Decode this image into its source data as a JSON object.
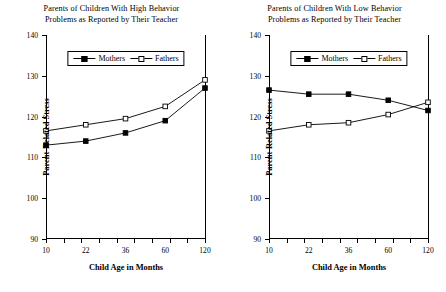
{
  "figure": {
    "width": 446,
    "height": 292,
    "background": "#ffffff",
    "line_color": "#000000"
  },
  "chart_data": [
    {
      "type": "line",
      "panel": "left",
      "title": "Parents of Children With High Behavior Problems as Reported by Their Teacher",
      "title_lines": [
        "Parents of Children With High Behavior",
        "Problems as Reported by Their Teacher"
      ],
      "xlabel": "Child Age in Months",
      "ylabel": "Parent-Related Stress",
      "x": [
        10,
        22,
        36,
        60,
        120
      ],
      "xticklabels": [
        "10",
        "22",
        "36",
        "60",
        "120"
      ],
      "yticks": [
        90,
        100,
        110,
        120,
        130,
        140
      ],
      "yticklabels": [
        "90",
        "100",
        "110",
        "120",
        "130",
        "140"
      ],
      "ylim": [
        90,
        140
      ],
      "xlim": [
        10,
        120
      ],
      "grid": false,
      "legend_position": "upper center",
      "series": [
        {
          "name": "Mothers",
          "marker": "filled-square",
          "values": [
            113.0,
            114.0,
            116.0,
            119.0,
            127.0
          ]
        },
        {
          "name": "Fathers",
          "marker": "open-square",
          "values": [
            116.5,
            118.0,
            119.5,
            122.5,
            129.0
          ]
        }
      ]
    },
    {
      "type": "line",
      "panel": "right",
      "title": "Parents of Children With Low Behavior Problems as Reported by Their Teacher",
      "title_lines": [
        "Parents of Children With Low Behavior",
        "Problems as Reported by Their Teacher"
      ],
      "xlabel": "Child Age in Months",
      "ylabel": "Parent-Related Stress",
      "x": [
        10,
        22,
        36,
        60,
        120
      ],
      "xticklabels": [
        "10",
        "22",
        "36",
        "60",
        "120"
      ],
      "yticks": [
        90,
        100,
        110,
        120,
        130,
        140
      ],
      "yticklabels": [
        "90",
        "100",
        "110",
        "120",
        "130",
        "140"
      ],
      "ylim": [
        90,
        140
      ],
      "xlim": [
        10,
        120
      ],
      "grid": false,
      "legend_position": "upper center",
      "series": [
        {
          "name": "Mothers",
          "marker": "filled-square",
          "values": [
            126.5,
            125.5,
            125.5,
            124.0,
            121.5
          ]
        },
        {
          "name": "Fathers",
          "marker": "open-square",
          "values": [
            116.5,
            118.0,
            118.5,
            120.5,
            123.5
          ]
        }
      ]
    }
  ]
}
